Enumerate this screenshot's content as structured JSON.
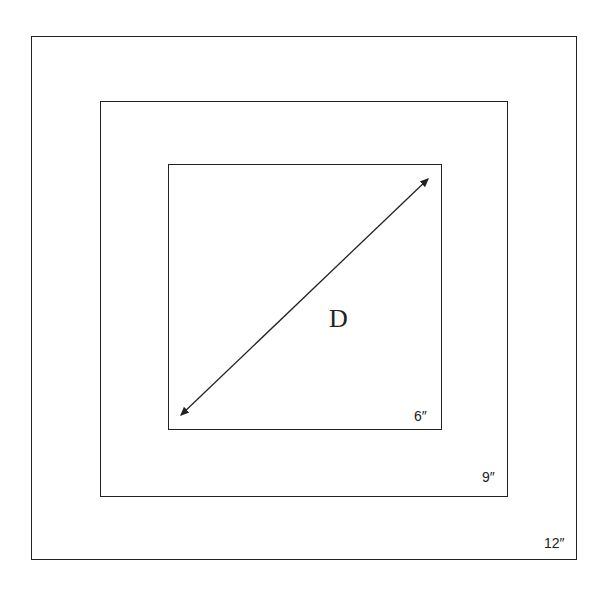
{
  "diagram": {
    "squares": [
      {
        "name": "outer",
        "label": "12″",
        "x": 31,
        "y": 36,
        "w": 546,
        "h": 524
      },
      {
        "name": "middle",
        "label": "9″",
        "x": 100,
        "y": 101,
        "w": 408,
        "h": 396
      },
      {
        "name": "inner",
        "label": "6″",
        "x": 168,
        "y": 164,
        "w": 274,
        "h": 266
      }
    ],
    "diagonal": {
      "label": "D",
      "from": [
        180,
        416
      ],
      "to": [
        429,
        178
      ]
    },
    "stroke_color": "#222222",
    "background": "#ffffff"
  }
}
